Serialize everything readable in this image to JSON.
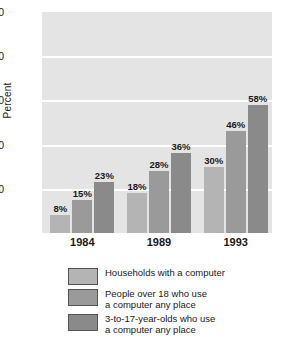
{
  "chart_data": {
    "type": "bar",
    "title": "",
    "xlabel": "",
    "ylabel": "Percent",
    "ylim": [
      0,
      100
    ],
    "yticks": [
      20,
      40,
      60,
      80,
      100
    ],
    "ytick_labels": [
      "20",
      "40",
      "60",
      "80",
      "100"
    ],
    "grid": "horizontal",
    "legend_position": "bottom",
    "categories": [
      "1984",
      "1989",
      "1993"
    ],
    "series": [
      {
        "name": "Households with a computer",
        "values": [
          8,
          18,
          30
        ],
        "labels": [
          "8%",
          "18%",
          "30%"
        ],
        "color": "#b4b4b4"
      },
      {
        "name": "People over 18 who use\na computer any place",
        "values": [
          15,
          28,
          46
        ],
        "labels": [
          "15%",
          "28%",
          "46%"
        ],
        "color": "#9a9a9a"
      },
      {
        "name": "3-to-17-year-olds who use\na computer any place",
        "values": [
          23,
          36,
          58
        ],
        "labels": [
          "23%",
          "36%",
          "58%"
        ],
        "color": "#8a8a8a"
      }
    ]
  }
}
